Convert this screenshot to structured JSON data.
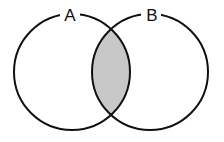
{
  "diagram": {
    "type": "venn",
    "sets": [
      {
        "label": "A",
        "cx": 72,
        "cy": 72,
        "r": 58
      },
      {
        "label": "B",
        "cx": 150,
        "cy": 72,
        "r": 58
      }
    ],
    "shaded_region": "A ∩ B",
    "colors": {
      "stroke": "#111111",
      "shade": "#c8c8c8",
      "background": "#ffffff"
    }
  }
}
